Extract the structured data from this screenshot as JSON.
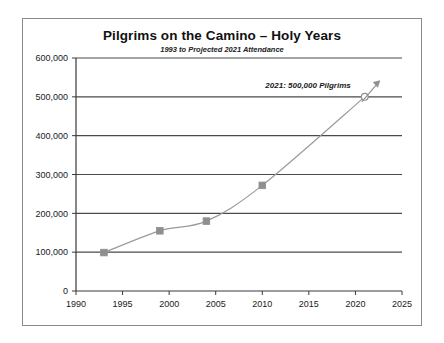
{
  "chart_data": {
    "type": "line",
    "title": "Pilgrims on the Camino – Holy Years",
    "subtitle": "1993 to Projected 2021 Attendance",
    "xlabel": "",
    "ylabel": "",
    "xlim": [
      1990,
      2025
    ],
    "ylim": [
      0,
      600000
    ],
    "grid": true,
    "legend": "none",
    "x_ticks": [
      "1990",
      "1995",
      "2000",
      "2005",
      "2010",
      "2015",
      "2020",
      "2025"
    ],
    "x_tick_values": [
      1990,
      1995,
      2000,
      2005,
      2010,
      2015,
      2020,
      2025
    ],
    "y_ticks": [
      "0",
      "100,000",
      "200,000",
      "300,000",
      "400,000",
      "500,000",
      "600,000"
    ],
    "y_tick_values": [
      0,
      100000,
      200000,
      300000,
      400000,
      500000,
      600000
    ],
    "series": [
      {
        "name": "Pilgrims on the Camino",
        "x": [
          1993,
          1999,
          2004,
          2010,
          2021
        ],
        "values": [
          99000,
          155000,
          180000,
          272000,
          500000
        ],
        "marker": "square",
        "line_color": "#9a9a9a",
        "marker_color": "#8f8f8f"
      }
    ],
    "points": [
      {
        "year": 1993,
        "value": 99000,
        "marker": "square"
      },
      {
        "year": 1999,
        "value": 155000,
        "marker": "square"
      },
      {
        "year": 2004,
        "value": 180000,
        "marker": "square"
      },
      {
        "year": 2010,
        "value": 272000,
        "marker": "square"
      },
      {
        "year": 2021,
        "value": 500000,
        "marker": "open-circle",
        "projected": true
      }
    ],
    "annotations": [
      {
        "text": "2021: 500,000 Pilgrims",
        "target_year": 2021,
        "target_value": 500000,
        "arrow": "up-right"
      }
    ],
    "colors": {
      "line": "#9a9a9a",
      "marker": "#8f8f8f",
      "axis": "#3a3a3a",
      "gridline": "#4a4a4a",
      "frame": "#8a8a8a",
      "text": "#111111",
      "background": "#ffffff"
    }
  }
}
